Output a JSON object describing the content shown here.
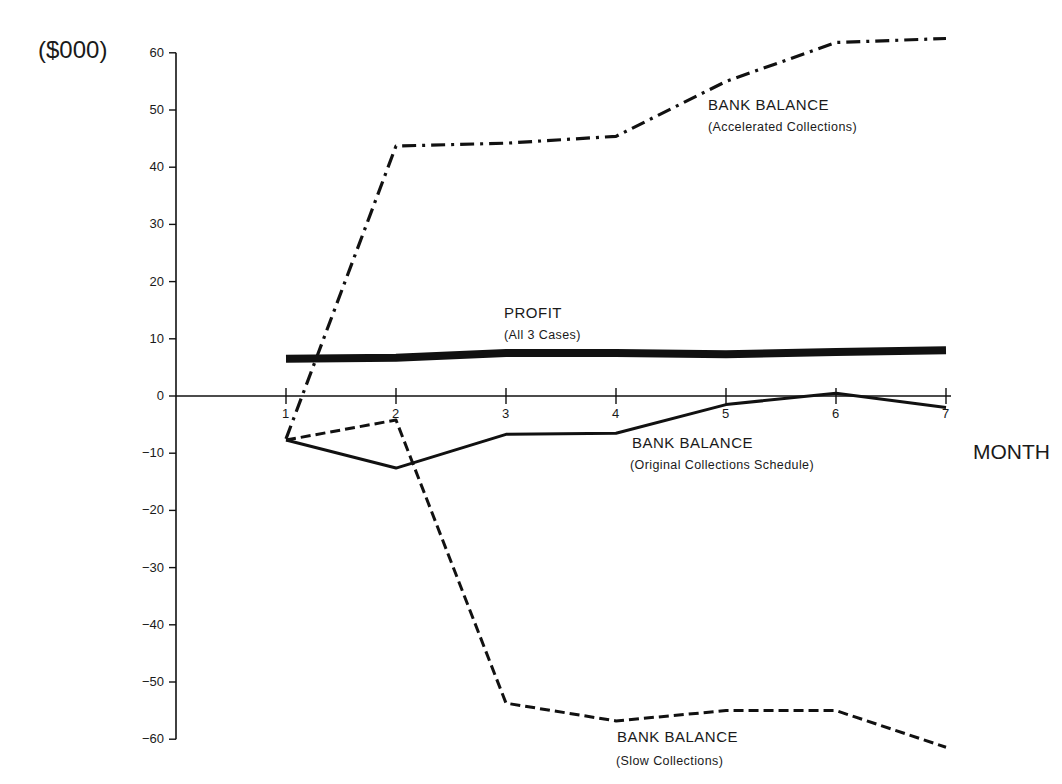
{
  "chart_data": {
    "type": "line",
    "title": "",
    "xlabel": "MONTH",
    "ylabel": "($000)",
    "x": [
      1,
      2,
      3,
      4,
      5,
      6,
      7
    ],
    "ylim": [
      -60,
      60
    ],
    "yticks": [
      60,
      50,
      40,
      30,
      20,
      10,
      0,
      -10,
      -20,
      -30,
      -40,
      -50,
      -60
    ],
    "xticks": [
      1,
      2,
      3,
      4,
      5,
      6,
      7
    ],
    "grid": false,
    "series": [
      {
        "name": "BANK BALANCE (Accelerated Collections)",
        "style": "dash-dot",
        "values": [
          -7.5,
          43.7,
          44.2,
          45.4,
          55.0,
          61.8,
          62.5
        ]
      },
      {
        "name": "PROFIT (All 3 Cases)",
        "style": "thick-solid",
        "values": [
          6.5,
          6.7,
          7.5,
          7.5,
          7.3,
          7.7,
          8.0
        ]
      },
      {
        "name": "BANK BALANCE (Original Collections Schedule)",
        "style": "solid",
        "values": [
          -7.7,
          -12.6,
          -6.7,
          -6.5,
          -1.5,
          0.5,
          -2.0
        ]
      },
      {
        "name": "BANK BALANCE (Slow Collections)",
        "style": "dashed",
        "values": [
          -7.7,
          -4.2,
          -53.7,
          -56.8,
          -55.0,
          -55.0,
          -61.4
        ]
      }
    ],
    "annotations": [
      {
        "main": "BANK BALANCE",
        "sub": "(Accelerated Collections)"
      },
      {
        "main": "PROFIT",
        "sub": "(All 3 Cases)"
      },
      {
        "main": "BANK BALANCE",
        "sub": "(Original Collections Schedule)"
      },
      {
        "main": "BANK BALANCE",
        "sub": "(Slow Collections)"
      }
    ]
  },
  "labels": {
    "unit": "($000)",
    "xaxis": "MONTH",
    "accel_main": "BANK BALANCE",
    "accel_sub": "(Accelerated Collections)",
    "profit_main": "PROFIT",
    "profit_sub": "(All 3 Cases)",
    "orig_main": "BANK BALANCE",
    "orig_sub": "(Original Collections Schedule)",
    "slow_main": "BANK BALANCE",
    "slow_sub": "(Slow Collections)"
  }
}
